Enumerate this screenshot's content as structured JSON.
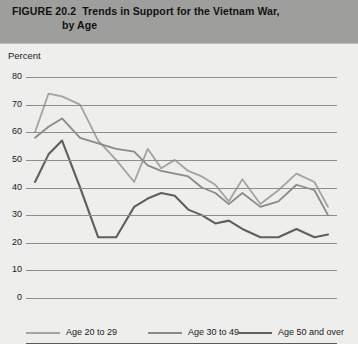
{
  "figure": {
    "label": "FIGURE 20.2",
    "title_line1": "Trends in Support for the Vietnam War,",
    "title_line2": "by Age"
  },
  "axis_title": "Percent",
  "colors": {
    "band": "#9e9e9c",
    "panel": "#eeeeec",
    "grid": "#8e8e8c",
    "age_20_29": "#a3a3a1",
    "age_30_49": "#8a8a88",
    "age_50_over": "#5f5f5d"
  },
  "legend": {
    "items": [
      {
        "label": "Age 20 to 29",
        "color": "#a3a3a1"
      },
      {
        "label": "Age 30 to 49",
        "color": "#8a8a88"
      },
      {
        "label": "Age 50 and over",
        "color": "#5f5f5d"
      }
    ]
  },
  "chart_data": {
    "type": "line",
    "title": "Trends in Support for the Vietnam War, by Age",
    "xlabel": "",
    "ylabel": "Percent",
    "ylim": [
      0,
      80
    ],
    "yticks": [
      0,
      10,
      20,
      30,
      40,
      50,
      60,
      70,
      80
    ],
    "xlim": [
      1964.6,
      1971.5
    ],
    "xticks": [
      1965,
      1966,
      1967,
      1968,
      1969,
      1970,
      1971
    ],
    "grid": true,
    "legend_position": "bottom",
    "series": [
      {
        "name": "Age 20 to 29",
        "color": "#a3a3a1",
        "x": [
          1964.8,
          1965.1,
          1965.4,
          1965.8,
          1966.2,
          1966.6,
          1967.0,
          1967.3,
          1967.6,
          1967.9,
          1968.2,
          1968.5,
          1968.8,
          1969.1,
          1969.4,
          1969.8,
          1970.2,
          1970.6,
          1971.0,
          1971.3
        ],
        "values": [
          60,
          74,
          73,
          70,
          57,
          50,
          42,
          54,
          47,
          50,
          46,
          44,
          41,
          35,
          43,
          34,
          39,
          45,
          42,
          33
        ]
      },
      {
        "name": "Age 30 to 49",
        "color": "#8a8a88",
        "x": [
          1964.8,
          1965.1,
          1965.4,
          1965.8,
          1966.2,
          1966.6,
          1967.0,
          1967.3,
          1967.6,
          1967.9,
          1968.2,
          1968.5,
          1968.8,
          1969.1,
          1969.4,
          1969.8,
          1970.2,
          1970.6,
          1971.0,
          1971.3
        ],
        "values": [
          58,
          62,
          65,
          58,
          56,
          54,
          53,
          48,
          46,
          45,
          44,
          40,
          38,
          34,
          38,
          33,
          35,
          41,
          39,
          30
        ]
      },
      {
        "name": "Age 50 and over",
        "color": "#5f5f5d",
        "x": [
          1964.8,
          1965.1,
          1965.4,
          1965.8,
          1966.2,
          1966.6,
          1967.0,
          1967.3,
          1967.6,
          1967.9,
          1968.2,
          1968.5,
          1968.8,
          1969.1,
          1969.4,
          1969.8,
          1970.2,
          1970.6,
          1971.0,
          1971.3
        ],
        "values": [
          42,
          52,
          57,
          40,
          22,
          22,
          33,
          36,
          38,
          37,
          32,
          30,
          27,
          28,
          25,
          22,
          22,
          25,
          22,
          23
        ]
      }
    ]
  }
}
